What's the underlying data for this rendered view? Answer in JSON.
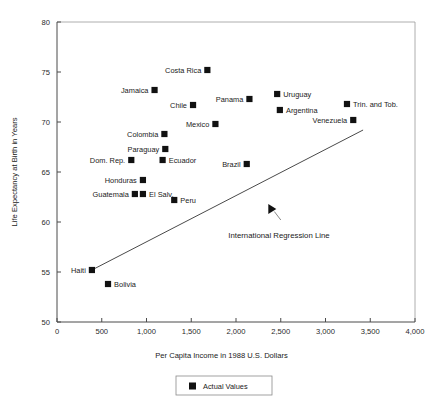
{
  "chart_data": {
    "type": "scatter",
    "title": "",
    "xlabel": "Per Capita Income in 1988 U.S. Dollars",
    "ylabel": "Life Expectancy at Birth in Years",
    "xlim": [
      0,
      4000
    ],
    "ylim": [
      50,
      80
    ],
    "xticks": [
      0,
      500,
      1000,
      1500,
      2000,
      2500,
      3000,
      3500,
      4000
    ],
    "xticklabels": [
      "0",
      "500",
      "1,000",
      "1,500",
      "2,000",
      "2,500",
      "3,000",
      "3,500",
      "4,000"
    ],
    "yticks": [
      50,
      55,
      60,
      65,
      70,
      75,
      80
    ],
    "yticklabels": [
      "50",
      "55",
      "60",
      "65",
      "70",
      "75",
      "80"
    ],
    "grid": false,
    "legend": {
      "position": "bottom-center",
      "entries": [
        {
          "label": "Actual Values",
          "marker": "filled-square",
          "color": "#111111"
        }
      ]
    },
    "series": [
      {
        "name": "Actual Values",
        "marker": "filled-square",
        "color": "#111111",
        "points": [
          {
            "label": "Costa Rica",
            "x": 1680,
            "y": 75.2,
            "label_pos": "left"
          },
          {
            "label": "Jamaica",
            "x": 1090,
            "y": 73.2,
            "label_pos": "left"
          },
          {
            "label": "Uruguay",
            "x": 2460,
            "y": 72.8,
            "label_pos": "right"
          },
          {
            "label": "Panama",
            "x": 2150,
            "y": 72.3,
            "label_pos": "left"
          },
          {
            "label": "Chile",
            "x": 1520,
            "y": 71.7,
            "label_pos": "left"
          },
          {
            "label": "Trin. and Tob.",
            "x": 3240,
            "y": 71.8,
            "label_pos": "right"
          },
          {
            "label": "Argentina",
            "x": 2490,
            "y": 71.2,
            "label_pos": "right"
          },
          {
            "label": "Venezuela",
            "x": 3310,
            "y": 70.2,
            "label_pos": "left"
          },
          {
            "label": "Mexico",
            "x": 1770,
            "y": 69.8,
            "label_pos": "left"
          },
          {
            "label": "Colombia",
            "x": 1200,
            "y": 68.8,
            "label_pos": "left"
          },
          {
            "label": "Paraguay",
            "x": 1210,
            "y": 67.3,
            "label_pos": "left"
          },
          {
            "label": "Ecuador",
            "x": 1180,
            "y": 66.2,
            "label_pos": "right"
          },
          {
            "label": "Dom. Rep.",
            "x": 830,
            "y": 66.2,
            "label_pos": "left"
          },
          {
            "label": "Brazil",
            "x": 2120,
            "y": 65.8,
            "label_pos": "left"
          },
          {
            "label": "Honduras",
            "x": 960,
            "y": 64.2,
            "label_pos": "left"
          },
          {
            "label": "Guatemala",
            "x": 870,
            "y": 62.8,
            "label_pos": "left"
          },
          {
            "label": "El Salv.",
            "x": 960,
            "y": 62.8,
            "label_pos": "right"
          },
          {
            "label": "Peru",
            "x": 1310,
            "y": 62.2,
            "label_pos": "right"
          },
          {
            "label": "Haiti",
            "x": 390,
            "y": 55.2,
            "label_pos": "left"
          },
          {
            "label": "Bolivia",
            "x": 570,
            "y": 53.8,
            "label_pos": "right"
          }
        ]
      }
    ],
    "regression_line": {
      "label": "International Regression Line",
      "x_start": 390,
      "y_start": 55.2,
      "x_end": 3420,
      "y_end": 69.2,
      "color": "#4a4a4a"
    },
    "annotations": [
      {
        "text": "International Regression Line",
        "text_x": 2480,
        "text_y": 58.4,
        "arrow_tip_x": 2400,
        "arrow_tip_y": 61.3
      }
    ]
  }
}
